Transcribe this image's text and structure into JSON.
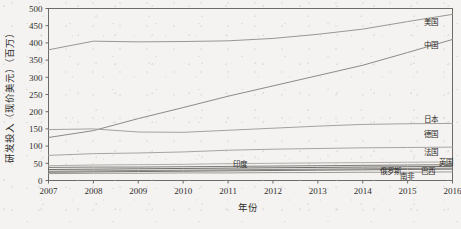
{
  "chart_data": {
    "type": "line",
    "title": "",
    "xlabel": "年份",
    "ylabel": "研发投入（现价美元）（百万）",
    "xlim": [
      2007,
      2016
    ],
    "ylim": [
      0,
      500
    ],
    "grid": false,
    "legend_position": "right-inline-labels",
    "x": [
      2007,
      2008,
      2009,
      2010,
      2011,
      2012,
      2013,
      2014,
      2015,
      2016
    ],
    "xticklabels": [
      "2007",
      "2008",
      "2009",
      "2010",
      "2011",
      "2012",
      "2013",
      "2014",
      "2015",
      "2016"
    ],
    "yticks": [
      0,
      50,
      100,
      150,
      200,
      250,
      300,
      350,
      400,
      450,
      500
    ],
    "yticklabels": [
      "0",
      "50",
      "100",
      "150",
      "200",
      "250",
      "300",
      "350",
      "400",
      "450",
      "500"
    ],
    "series": [
      {
        "name": "美国",
        "label": "美国",
        "color": "#9a9793",
        "values": [
          380,
          405,
          403,
          404,
          406,
          413,
          425,
          440,
          462,
          483
        ]
      },
      {
        "name": "中国",
        "label": "中国",
        "color": "#8d8a86",
        "values": [
          125,
          145,
          180,
          212,
          245,
          275,
          305,
          335,
          372,
          410
        ]
      },
      {
        "name": "日本",
        "label": "日本",
        "color": "#a5a29e",
        "values": [
          148,
          150,
          141,
          140,
          146,
          152,
          158,
          163,
          165,
          166
        ]
      },
      {
        "name": "德国",
        "label": "德国",
        "color": "#a8a5a1",
        "values": [
          73,
          78,
          80,
          83,
          88,
          91,
          93,
          95,
          96,
          97
        ]
      },
      {
        "name": "法国",
        "label": "法国",
        "color": "#b0ada9",
        "values": [
          43,
          45,
          46,
          47,
          49,
          50,
          51,
          52,
          53,
          54
        ]
      },
      {
        "name": "英国",
        "label": "英国",
        "color": "#7e7b78",
        "values": [
          38,
          39,
          39,
          40,
          41,
          42,
          43,
          44,
          45,
          46
        ]
      },
      {
        "name": "印度",
        "label": "印度",
        "color": "#6f6c69",
        "values": [
          32,
          33,
          34,
          35,
          36,
          37,
          38,
          39,
          40,
          41
        ]
      },
      {
        "name": "俄罗斯",
        "label": "俄罗斯",
        "color": "#8a8784",
        "values": [
          27,
          28,
          29,
          30,
          31,
          32,
          33,
          34,
          35,
          36
        ]
      },
      {
        "name": "巴西",
        "label": "巴西",
        "color": "#76736f",
        "values": [
          24,
          25,
          26,
          27,
          28,
          29,
          30,
          31,
          32,
          33
        ]
      },
      {
        "name": "南非",
        "label": "南非",
        "color": "#9d9a96",
        "values": [
          20,
          21,
          21,
          22,
          22,
          23,
          23,
          24,
          24,
          25
        ]
      }
    ],
    "inline_labels": [
      {
        "text": "美国",
        "x": 424,
        "y": 25
      },
      {
        "text": "中国",
        "x": 424,
        "y": 48
      },
      {
        "text": "日本",
        "x": 424,
        "y": 122
      },
      {
        "text": "德国",
        "x": 424,
        "y": 137
      },
      {
        "text": "法国",
        "x": 424,
        "y": 155
      },
      {
        "text": "英国",
        "x": 439,
        "y": 165
      },
      {
        "text": "巴西",
        "x": 421,
        "y": 174
      },
      {
        "text": "俄罗斯",
        "x": 380,
        "y": 174
      },
      {
        "text": "南非",
        "x": 400,
        "y": 179
      },
      {
        "text": "印度",
        "x": 233,
        "y": 167
      }
    ]
  }
}
